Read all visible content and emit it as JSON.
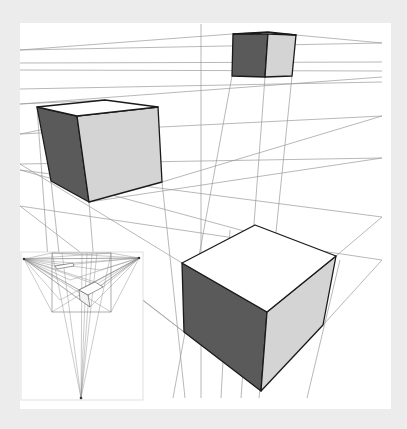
{
  "figure": {
    "background": "#ececec",
    "canvas": {
      "x": 20,
      "y": 23,
      "w": 371,
      "h": 386,
      "fill": "#ffffff"
    },
    "colors": {
      "guide": "#9a9a9a",
      "edge": "#1a1a1a",
      "dark_face": "#5a5a5a",
      "light_face": "#d4d4d4",
      "top_face": "#ffffff"
    }
  },
  "guides": [
    [
      20,
      50,
      382,
      43
    ],
    [
      20,
      63,
      382,
      62
    ],
    [
      20,
      70,
      382,
      71
    ],
    [
      20,
      89,
      382,
      82
    ],
    [
      20,
      104,
      382,
      77
    ],
    [
      20,
      134,
      382,
      116
    ],
    [
      20,
      164,
      382,
      158
    ],
    [
      20,
      170,
      382,
      217
    ],
    [
      20,
      206,
      382,
      260
    ],
    [
      20,
      50,
      232,
      34
    ],
    [
      296,
      35,
      382,
      43
    ],
    [
      201,
      24,
      201,
      398
    ],
    [
      232,
      76,
      173,
      398
    ],
    [
      265,
      77,
      241,
      398
    ],
    [
      292,
      76,
      259,
      398
    ],
    [
      51,
      181,
      75,
      398
    ],
    [
      89,
      202,
      105,
      398
    ],
    [
      162,
      182,
      185,
      398
    ],
    [
      37,
      107,
      58,
      398
    ],
    [
      20,
      164,
      182,
      263
    ],
    [
      20,
      170,
      336,
      256
    ],
    [
      20,
      206,
      184,
      332
    ],
    [
      20,
      134,
      158,
      107
    ],
    [
      20,
      104,
      105,
      100
    ],
    [
      162,
      182,
      382,
      116
    ],
    [
      89,
      202,
      382,
      158
    ],
    [
      323,
      325,
      382,
      260
    ],
    [
      336,
      256,
      382,
      217
    ],
    [
      143,
      300,
      184,
      332
    ],
    [
      221,
      398,
      230,
      230
    ],
    [
      307,
      398,
      340,
      260
    ]
  ],
  "cubes": [
    {
      "name": "top-small-cube",
      "top": [
        [
          233,
          34
        ],
        [
          268,
          32
        ],
        [
          296,
          35
        ],
        [
          268,
          34
        ]
      ],
      "dark": [
        [
          233,
          34
        ],
        [
          268,
          33
        ],
        [
          265,
          77
        ],
        [
          232,
          76
        ]
      ],
      "light": [
        [
          268,
          33
        ],
        [
          296,
          35
        ],
        [
          292,
          76
        ],
        [
          265,
          77
        ]
      ]
    },
    {
      "name": "left-medium-cube",
      "top": [
        [
          37,
          107
        ],
        [
          105,
          100
        ],
        [
          158,
          107
        ],
        [
          77,
          116
        ]
      ],
      "dark": [
        [
          37,
          107
        ],
        [
          77,
          116
        ],
        [
          89,
          202
        ],
        [
          51,
          181
        ]
      ],
      "light": [
        [
          77,
          116
        ],
        [
          158,
          107
        ],
        [
          162,
          182
        ],
        [
          89,
          202
        ]
      ]
    },
    {
      "name": "bottom-large-cube",
      "top": [
        [
          182,
          263
        ],
        [
          255,
          225
        ],
        [
          336,
          256
        ],
        [
          267,
          312
        ]
      ],
      "dark": [
        [
          182,
          263
        ],
        [
          267,
          312
        ],
        [
          261,
          391
        ],
        [
          184,
          332
        ]
      ],
      "light": [
        [
          267,
          312
        ],
        [
          336,
          256
        ],
        [
          323,
          325
        ],
        [
          261,
          391
        ]
      ]
    }
  ],
  "inset": {
    "frame": {
      "x": 21,
      "y": 252,
      "w": 122,
      "h": 148
    },
    "inner_box": {
      "x": 52,
      "y": 253,
      "w": 59,
      "h": 59
    },
    "vanishing_points": {
      "left": [
        24,
        259
      ],
      "right": [
        139,
        258
      ],
      "bottom": [
        81,
        398
      ]
    },
    "mini_cube_top": [
      [
        79,
        290
      ],
      [
        95,
        282
      ],
      [
        103,
        287
      ],
      [
        88,
        295
      ]
    ],
    "mini_cube_side": [
      [
        79,
        290
      ],
      [
        88,
        295
      ],
      [
        90,
        307
      ],
      [
        80,
        300
      ]
    ],
    "mini_slab": [
      [
        55,
        266
      ],
      [
        73,
        263
      ],
      [
        74,
        266
      ],
      [
        57,
        269
      ]
    ],
    "verticals_x": [
      52,
      62,
      82,
      87,
      92,
      97,
      111
    ]
  }
}
